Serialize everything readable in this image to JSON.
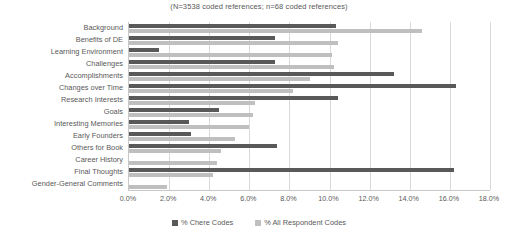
{
  "chart_data": {
    "type": "bar",
    "orientation": "horizontal",
    "title": "(N=3538 coded references; n=68 coded references)",
    "xlabel": "",
    "ylabel": "",
    "xlim": [
      0,
      18
    ],
    "xticks": [
      "0.0%",
      "2.0%",
      "4.0%",
      "6.0%",
      "8.0%",
      "10.0%",
      "12.0%",
      "14.0%",
      "16.0%",
      "18.0%"
    ],
    "xtick_values": [
      0,
      2,
      4,
      6,
      8,
      10,
      12,
      14,
      16,
      18
    ],
    "grid": true,
    "legend_position": "bottom",
    "categories": [
      "Background",
      "Benefits of DE",
      "Learning Environment",
      "Challenges",
      "Accomplishments",
      "Changes over Time",
      "Research Interests",
      "Goals",
      "Interesting Memories",
      "Early Founders",
      "Others for Book",
      "Career History",
      "Final Thoughts",
      "Gender-General Comments"
    ],
    "series": [
      {
        "name": "% Chere Codes",
        "color": "#595959",
        "values": [
          10.3,
          7.3,
          1.5,
          7.3,
          13.2,
          16.3,
          10.4,
          4.5,
          3.0,
          3.1,
          7.4,
          0.0,
          16.2,
          0.0
        ]
      },
      {
        "name": "% All Respondent Codes",
        "color": "#bfbfbf",
        "values": [
          14.6,
          10.4,
          10.1,
          10.2,
          9.0,
          8.2,
          6.3,
          6.2,
          6.0,
          5.3,
          4.6,
          4.4,
          4.2,
          1.9
        ]
      }
    ]
  }
}
